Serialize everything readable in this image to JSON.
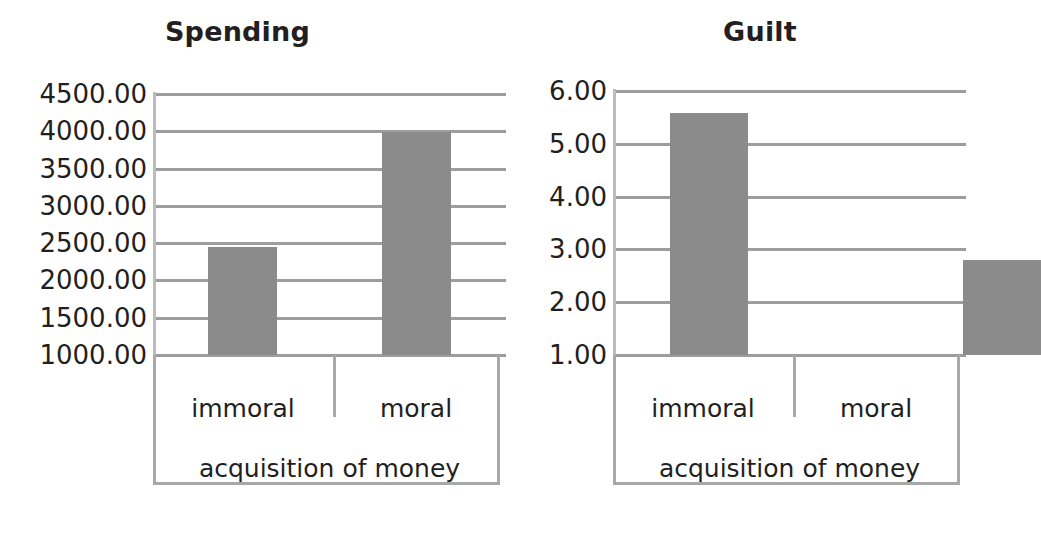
{
  "figure": {
    "background_color": "#ffffff",
    "bar_color": "#8b8b8b",
    "gridline_color": "#9d9d9d",
    "axis_color": "#a8a8a8",
    "text_color": "#231f20"
  },
  "chart_data": [
    {
      "type": "bar",
      "title": "Spending",
      "xlabel": "acquisition of money",
      "ylabel": "",
      "categories": [
        "immoral",
        "moral"
      ],
      "values": [
        2450.0,
        3995.0
      ],
      "ytick_labels": [
        "4500.00",
        "4000.00",
        "3500.00",
        "3000.00",
        "2500.00",
        "2000.00",
        "1500.00",
        "1000.00"
      ],
      "ytick_values": [
        4500,
        4000,
        3500,
        3000,
        2500,
        2000,
        1500,
        1000
      ],
      "ylim": [
        1000,
        4500
      ],
      "grid": true,
      "legend": "none"
    },
    {
      "type": "bar",
      "title": "Guilt",
      "xlabel": "acquisition of money",
      "ylabel": "",
      "categories": [
        "immoral",
        "moral"
      ],
      "values": [
        5.58,
        2.79
      ],
      "ytick_labels": [
        "6.00",
        "5.00",
        "4.00",
        "3.00",
        "2.00",
        "1.00"
      ],
      "ytick_values": [
        6,
        5,
        4,
        3,
        2,
        1
      ],
      "ylim": [
        1,
        6
      ],
      "grid": true,
      "legend": "none"
    }
  ]
}
